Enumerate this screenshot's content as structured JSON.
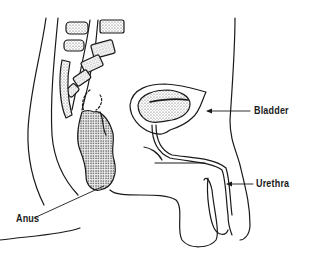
{
  "diagram": {
    "labels": {
      "bladder": "Bladder",
      "urethra": "Urethra",
      "anus": "Anus"
    },
    "colors": {
      "line": "#1a1a1a",
      "background": "#ffffff",
      "stipple": "#555555"
    }
  }
}
